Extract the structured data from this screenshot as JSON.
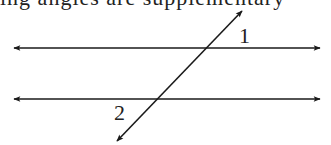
{
  "header": {
    "cut_off_text": "ing angles are supplementary"
  },
  "diagram": {
    "type": "parallel lines cut by a transversal",
    "labels": {
      "angle1": "1",
      "angle2": "2"
    },
    "colors": {
      "stroke": "#1a1a1a",
      "background": "#ffffff"
    }
  }
}
